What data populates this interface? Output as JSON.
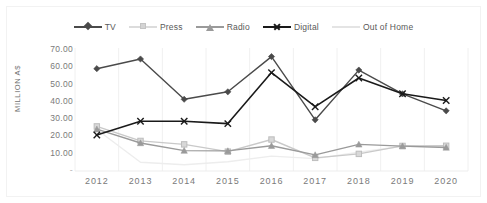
{
  "chart_data": {
    "type": "line",
    "title": "",
    "xlabel": "",
    "ylabel": "MILLION A$",
    "categories": [
      "2012",
      "2013",
      "2014",
      "2015",
      "2016",
      "2017",
      "2018",
      "2019",
      "2020"
    ],
    "ylim": [
      0,
      70
    ],
    "ytick_labels": [
      "70.00",
      "60.00",
      "50.00",
      "40.00",
      "30.00",
      "20.00",
      "10.00",
      "-"
    ],
    "ytick_values": [
      70,
      60,
      50,
      40,
      30,
      20,
      10,
      0
    ],
    "grid": "vertical-only",
    "legend_position": "top-center",
    "series": [
      {
        "name": "TV",
        "marker": "diamond",
        "color": "#4a4a4a",
        "values": [
          59.2,
          64.8,
          41.5,
          45.8,
          66.2,
          29.6,
          58.4,
          44.6,
          34.8
        ]
      },
      {
        "name": "Press",
        "marker": "square",
        "color": "#c9c9c9",
        "values": [
          25.8,
          17.4,
          15.4,
          11.2,
          18.2,
          7.6,
          9.9,
          14.5,
          14.6
        ]
      },
      {
        "name": "Radio",
        "marker": "triangle",
        "color": "#9a9a9a",
        "values": [
          24.2,
          16.2,
          11.8,
          11.6,
          14.6,
          9.3,
          15.4,
          14.4,
          13.6
        ]
      },
      {
        "name": "Digital",
        "marker": "x",
        "color": "#1a1a1a",
        "values": [
          20.8,
          28.8,
          28.8,
          27.4,
          56.9,
          37.2,
          53.8,
          44.7,
          40.8
        ]
      },
      {
        "name": "Out of Home",
        "marker": "none",
        "color": "#ededed",
        "values": [
          24.0,
          5.1,
          3.6,
          5.4,
          8.6,
          7.2,
          10.8,
          14.3,
          14.2
        ]
      }
    ]
  },
  "legend": {
    "items": [
      {
        "label": "TV"
      },
      {
        "label": "Press"
      },
      {
        "label": "Radio"
      },
      {
        "label": "Digital"
      },
      {
        "label": "Out of Home"
      }
    ]
  }
}
